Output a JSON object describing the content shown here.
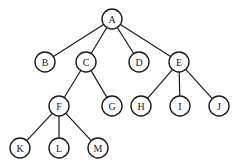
{
  "diagram": {
    "type": "tree",
    "radius": 10,
    "nodes": [
      {
        "id": "A",
        "label": "A",
        "x": 112,
        "y": 19
      },
      {
        "id": "B",
        "label": "B",
        "x": 45,
        "y": 62
      },
      {
        "id": "C",
        "label": "C",
        "x": 86,
        "y": 62
      },
      {
        "id": "D",
        "label": "D",
        "x": 139,
        "y": 62
      },
      {
        "id": "E",
        "label": "E",
        "x": 179,
        "y": 62
      },
      {
        "id": "F",
        "label": "F",
        "x": 59,
        "y": 106
      },
      {
        "id": "G",
        "label": "G",
        "x": 112,
        "y": 106
      },
      {
        "id": "H",
        "label": "H",
        "x": 141,
        "y": 106
      },
      {
        "id": "I",
        "label": "I",
        "x": 180,
        "y": 106
      },
      {
        "id": "J",
        "label": "J",
        "x": 219,
        "y": 106
      },
      {
        "id": "K",
        "label": "K",
        "x": 20,
        "y": 148
      },
      {
        "id": "L",
        "label": "L",
        "x": 59,
        "y": 148
      },
      {
        "id": "M",
        "label": "M",
        "x": 98,
        "y": 148
      }
    ],
    "edges": [
      [
        "A",
        "B"
      ],
      [
        "A",
        "C"
      ],
      [
        "A",
        "D"
      ],
      [
        "A",
        "E"
      ],
      [
        "C",
        "F"
      ],
      [
        "C",
        "G"
      ],
      [
        "E",
        "H"
      ],
      [
        "E",
        "I"
      ],
      [
        "E",
        "J"
      ],
      [
        "F",
        "K"
      ],
      [
        "F",
        "L"
      ],
      [
        "F",
        "M"
      ]
    ]
  }
}
